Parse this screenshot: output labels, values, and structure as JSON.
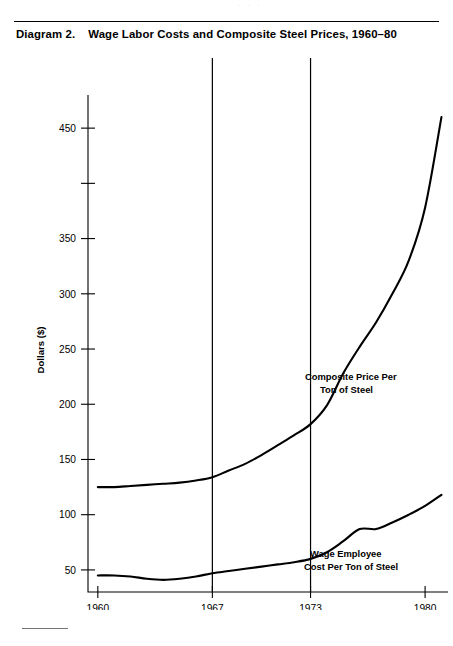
{
  "page": {
    "bleed_artifact": "· · ·",
    "diagram_label": "Diagram 2.",
    "diagram_title": "Wage Labor Costs and Composite Steel Prices, 1960–80"
  },
  "chart_data": {
    "type": "line",
    "title": "Wage Labor Costs and Composite Steel Prices, 1960–80",
    "xlabel": "Year",
    "ylabel": "Dollars ($)",
    "xlim": [
      1959.4,
      1981.4
    ],
    "ylim": [
      30,
      480
    ],
    "grid": false,
    "legend": "annotations-inline",
    "x_ticks": [
      1960,
      1967,
      1973,
      1980
    ],
    "x_tick_labels": [
      "1960",
      "1967",
      "1973",
      "1980"
    ],
    "y_ticks": [
      50,
      100,
      150,
      200,
      250,
      300,
      350,
      400,
      450
    ],
    "y_tick_labels": [
      "50",
      "100",
      "150",
      "200",
      "250",
      "300",
      "350",
      "",
      "450"
    ],
    "vertical_reference_lines": [
      1967,
      1973
    ],
    "series": [
      {
        "name": "Composite Price Per Ton of Steel",
        "annotation": [
          "Composite Price Per",
          "Ton of Steel"
        ],
        "x": [
          1960,
          1961,
          1962,
          1963,
          1964,
          1965,
          1966,
          1967,
          1968,
          1969,
          1970,
          1971,
          1972,
          1973,
          1974,
          1975,
          1976,
          1977,
          1978,
          1979,
          1980,
          1981
        ],
        "values": [
          125,
          125,
          126,
          127,
          128,
          129,
          131,
          134,
          140,
          146,
          154,
          163,
          172,
          182,
          199,
          228,
          252,
          274,
          300,
          330,
          378,
          460
        ]
      },
      {
        "name": "Wage Employee Cost Per Ton of Steel",
        "annotation": [
          "Wage Employee",
          "Cost Per Ton of Steel"
        ],
        "x": [
          1960,
          1961,
          1962,
          1963,
          1964,
          1965,
          1966,
          1967,
          1968,
          1969,
          1970,
          1971,
          1972,
          1973,
          1974,
          1975,
          1976,
          1977,
          1978,
          1979,
          1980,
          1981
        ],
        "values": [
          45,
          45,
          44,
          42,
          41,
          42,
          44,
          47,
          49,
          51,
          53,
          55,
          57,
          60,
          66,
          76,
          87,
          87,
          93,
          100,
          108,
          118
        ]
      }
    ]
  },
  "axes": {
    "y_axis_title": "Dollars ($)",
    "x_axis_title": "Year"
  }
}
